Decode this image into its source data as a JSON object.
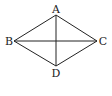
{
  "diagram": {
    "type": "rhombus-with-diagonals",
    "stroke_color": "#222222",
    "background": "#ffffff",
    "vertices": {
      "A": {
        "label": "A",
        "x": 56,
        "y": 15
      },
      "B": {
        "label": "B",
        "x": 14,
        "y": 41
      },
      "C": {
        "label": "C",
        "x": 97,
        "y": 41
      },
      "D": {
        "label": "D",
        "x": 56,
        "y": 66
      }
    },
    "edges": [
      "AB",
      "AC",
      "BD",
      "CD"
    ],
    "diagonals": [
      "AD",
      "BC"
    ],
    "labels": {
      "A": "A",
      "B": "B",
      "C": "C",
      "D": "D"
    }
  }
}
